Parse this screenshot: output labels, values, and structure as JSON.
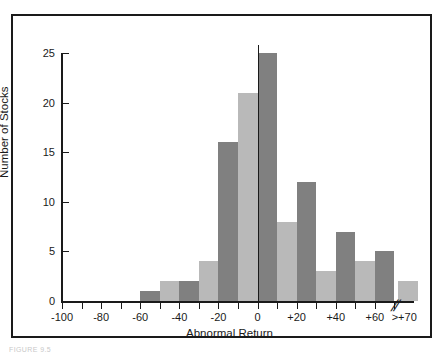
{
  "figure": {
    "caption": "FIGURE 9.5",
    "frame_color": "#1a1a1a",
    "background": "#ffffff"
  },
  "chart_data": {
    "type": "bar",
    "title": "",
    "subtitle": "",
    "xlabel": "Abnormal Return",
    "ylabel": "Number of Stocks",
    "xlim": [
      -100,
      80
    ],
    "ylim": [
      0,
      26.5
    ],
    "grid": false,
    "legend": null,
    "axis_break": {
      "present": true,
      "symbol": "//",
      "at_x": 68,
      "note": "break between +70 and the >+70 overflow category"
    },
    "zero_reference_line": {
      "present": true,
      "x": 0,
      "color": "#1a1a1a"
    },
    "bar_colors": {
      "dark": "#808080",
      "light": "#b9b9b9"
    },
    "x_tick_labels": [
      "-100",
      "-80",
      "-60",
      "-40",
      "-20",
      "0",
      "+20",
      "+40",
      "+60",
      ">+70"
    ],
    "x_tick_values": [
      -100,
      -80,
      -60,
      -40,
      -20,
      0,
      20,
      40,
      60,
      75
    ],
    "x_minor_tick_values": [
      -90,
      -70,
      -50,
      -30,
      -10,
      10,
      30,
      50,
      70
    ],
    "y_tick_labels": [
      "0",
      "5",
      "10",
      "15",
      "20",
      "25"
    ],
    "y_tick_values": [
      0,
      5,
      10,
      15,
      20,
      25
    ],
    "categories": [
      "-100 to -90",
      "-90 to -80",
      "-80 to -70",
      "-70 to -60",
      "-60 to -50",
      "-50 to -40",
      "-40 to -30",
      "-30 to -20",
      "-20 to -10",
      "-10 to 0",
      "0 to +10",
      "+10 to +20",
      "+20 to +30",
      "+30 to +40",
      "+40 to +50",
      "+50 to +60",
      "+60 to +70",
      ">+70"
    ],
    "bars": [
      {
        "label": "-100 to -90",
        "x0": -100,
        "x1": -90,
        "value": 0,
        "shade": "dark"
      },
      {
        "label": "-90 to -80",
        "x0": -90,
        "x1": -80,
        "value": 0,
        "shade": "light"
      },
      {
        "label": "-80 to -70",
        "x0": -80,
        "x1": -70,
        "value": 0,
        "shade": "dark"
      },
      {
        "label": "-70 to -60",
        "x0": -70,
        "x1": -60,
        "value": 0,
        "shade": "light"
      },
      {
        "label": "-60 to -50",
        "x0": -60,
        "x1": -50,
        "value": 1,
        "shade": "dark"
      },
      {
        "label": "-50 to -40",
        "x0": -50,
        "x1": -40,
        "value": 2,
        "shade": "light"
      },
      {
        "label": "-40 to -30",
        "x0": -40,
        "x1": -30,
        "value": 2,
        "shade": "dark"
      },
      {
        "label": "-30 to -20",
        "x0": -30,
        "x1": -20,
        "value": 4,
        "shade": "light"
      },
      {
        "label": "-20 to -10",
        "x0": -20,
        "x1": -10,
        "value": 16,
        "shade": "dark"
      },
      {
        "label": "-10 to 0",
        "x0": -10,
        "x1": 0,
        "value": 21,
        "shade": "light"
      },
      {
        "label": "0 to +10",
        "x0": 0,
        "x1": 10,
        "value": 25,
        "shade": "dark"
      },
      {
        "label": "+10 to +20",
        "x0": 10,
        "x1": 20,
        "value": 8,
        "shade": "light"
      },
      {
        "label": "+20 to +30",
        "x0": 20,
        "x1": 30,
        "value": 12,
        "shade": "dark"
      },
      {
        "label": "+30 to +40",
        "x0": 30,
        "x1": 40,
        "value": 3,
        "shade": "light"
      },
      {
        "label": "+40 to +50",
        "x0": 40,
        "x1": 50,
        "value": 7,
        "shade": "dark"
      },
      {
        "label": "+50 to +60",
        "x0": 50,
        "x1": 60,
        "value": 4,
        "shade": "light"
      },
      {
        "label": "+60 to +70",
        "x0": 60,
        "x1": 70,
        "value": 5,
        "shade": "dark"
      },
      {
        "label": ">+70",
        "x0": 72,
        "x1": 82,
        "value": 2,
        "shade": "light"
      }
    ],
    "values": [
      0,
      0,
      0,
      0,
      1,
      2,
      2,
      4,
      16,
      21,
      25,
      8,
      12,
      3,
      7,
      4,
      5,
      2
    ]
  }
}
